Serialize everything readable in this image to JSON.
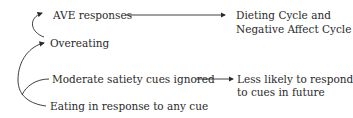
{
  "diagram": {
    "nodes": {
      "ave": {
        "label": "AVE responses"
      },
      "overeating": {
        "label": "Overeating"
      },
      "moderate": {
        "label": "Moderate satiety cues ignored"
      },
      "eating": {
        "label": "Eating in response to any cue"
      },
      "dieting": {
        "line1": "Dieting Cycle and",
        "line2": "Negative Affect Cycle"
      },
      "less_likely": {
        "line1": "Less likely to respond",
        "line2": "to cues in future"
      }
    },
    "edges": [
      {
        "from": "overeating",
        "to": "ave",
        "style": "curved"
      },
      {
        "from": "eating",
        "to": "overeating",
        "style": "curved"
      },
      {
        "from": "moderate",
        "to": "eating-curve",
        "style": "curved-branch"
      },
      {
        "from": "ave",
        "to": "dieting",
        "style": "straight"
      },
      {
        "from": "moderate",
        "to": "less_likely",
        "style": "straight"
      }
    ],
    "colors": {
      "text": "#2a2a2a",
      "line": "#2a2a2a",
      "background": "#ffffff"
    }
  }
}
